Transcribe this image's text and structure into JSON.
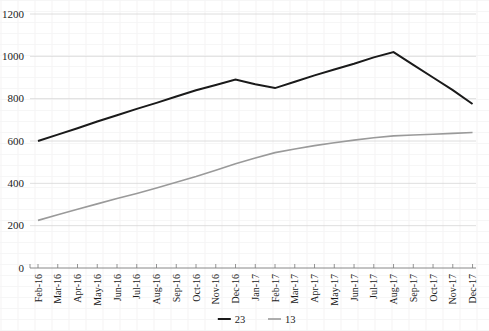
{
  "chart_data": {
    "type": "line",
    "title": "",
    "subtitle": "",
    "xlabel": "",
    "ylabel": "",
    "ylim": [
      0,
      1200
    ],
    "ytick_values": [
      0,
      200,
      400,
      600,
      800,
      1000,
      1200
    ],
    "ytick_labels": [
      "0",
      "200",
      "400",
      "600",
      "800",
      "1000",
      "1200"
    ],
    "grid": "horizontal",
    "legend_position": "bottom-center",
    "categories": [
      "Feb-16",
      "Mar-16",
      "Apr-16",
      "May-16",
      "Jun-16",
      "Jul-16",
      "Aug-16",
      "Sep-16",
      "Oct-16",
      "Nov-16",
      "Dec-16",
      "Jan-17",
      "Feb-17",
      "Mar-17",
      "Apr-17",
      "May-17",
      "Jun-17",
      "Jul-17",
      "Aug-17",
      "Sep-17",
      "Oct-17",
      "Nov-17",
      "Dec-17"
    ],
    "series": [
      {
        "name": "23",
        "color": "#1a1a1a",
        "width": 2.0,
        "values": [
          600,
          630,
          660,
          692,
          722,
          752,
          780,
          810,
          840,
          865,
          890,
          868,
          850,
          880,
          910,
          938,
          965,
          995,
          1020,
          960,
          900,
          840,
          775
        ]
      },
      {
        "name": "13",
        "color": "#9a9a9a",
        "width": 1.6,
        "values": [
          225,
          252,
          278,
          303,
          328,
          352,
          378,
          405,
          432,
          462,
          492,
          520,
          545,
          562,
          578,
          592,
          604,
          615,
          624,
          628,
          632,
          636,
          640
        ]
      }
    ]
  },
  "legend": {
    "entries": [
      {
        "label": "23",
        "color": "#1a1a1a"
      },
      {
        "label": "13",
        "color": "#9a9a9a"
      }
    ]
  }
}
